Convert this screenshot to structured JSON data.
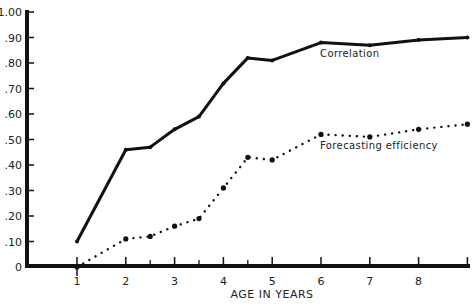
{
  "chart_data": {
    "type": "line",
    "title": "",
    "xlabel": "AGE IN YEARS",
    "ylabel": "",
    "xlim": [
      1,
      9
    ],
    "ylim": [
      0,
      1.0
    ],
    "grid": false,
    "legend": "inline labels",
    "x_tick_labels": [
      "1",
      "2",
      "3",
      "4",
      "5",
      "6",
      "7",
      "8"
    ],
    "y_tick_labels": [
      "0",
      ".10",
      ".20",
      ".30",
      ".40",
      ".50",
      ".60",
      ".70",
      ".80",
      ".90",
      "1.00"
    ],
    "x": [
      1,
      2,
      2.5,
      3,
      3.5,
      4,
      4.5,
      5,
      6,
      7,
      8,
      9
    ],
    "series": [
      {
        "name": "Correlation",
        "style": "solid",
        "values": [
          0.1,
          0.46,
          0.47,
          0.54,
          0.59,
          0.72,
          0.82,
          0.81,
          0.88,
          0.87,
          0.89,
          0.9
        ]
      },
      {
        "name": "Forecasting efficiency",
        "style": "dotted",
        "values": [
          0.0,
          0.11,
          0.12,
          0.16,
          0.19,
          0.31,
          0.43,
          0.42,
          0.52,
          0.51,
          0.54,
          0.56
        ]
      }
    ]
  },
  "labels": {
    "xlabel": "AGE IN YEARS",
    "series0": "Correlation",
    "series1": "Forecasting efficiency"
  }
}
